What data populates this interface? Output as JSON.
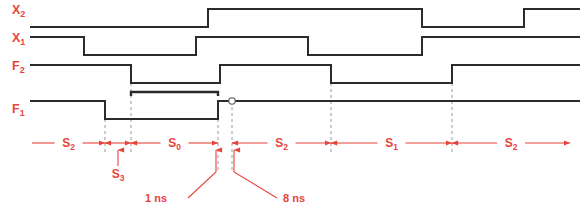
{
  "figure": {
    "type": "timing-diagram",
    "title": "",
    "background_color": "#ffffff",
    "waveform_color": "#2b2b2b",
    "annotation_color": "#e8443a",
    "gridline_color": "#9a9a9a",
    "width": 588,
    "height": 215
  },
  "signals": [
    {
      "id": "x2",
      "name": "X",
      "subscript": "2",
      "label_x": 12,
      "label_y": 14,
      "high_y": 9,
      "low_y": 27,
      "start_x": 30,
      "end_x": 580,
      "initial_level": "low",
      "transitions": [
        {
          "x": 208,
          "to": "high"
        },
        {
          "x": 422,
          "to": "low"
        },
        {
          "x": 524,
          "to": "high"
        }
      ]
    },
    {
      "id": "x1",
      "name": "X",
      "subscript": "1",
      "label_x": 12,
      "label_y": 42,
      "high_y": 37,
      "low_y": 55,
      "start_x": 30,
      "end_x": 580,
      "initial_level": "high",
      "transitions": [
        {
          "x": 84,
          "to": "low"
        },
        {
          "x": 196,
          "to": "high"
        },
        {
          "x": 308,
          "to": "low"
        },
        {
          "x": 422,
          "to": "high"
        }
      ]
    },
    {
      "id": "f2",
      "name": "F",
      "subscript": "2",
      "label_x": 12,
      "label_y": 70,
      "high_y": 65,
      "low_y": 83,
      "start_x": 30,
      "end_x": 580,
      "initial_level": "high",
      "transitions": [
        {
          "x": 131,
          "to": "low"
        },
        {
          "x": 220,
          "to": "high"
        },
        {
          "x": 331,
          "to": "low"
        },
        {
          "x": 452,
          "to": "high"
        }
      ]
    },
    {
      "id": "f1",
      "name": "F",
      "subscript": "1",
      "label_x": 12,
      "label_y": 113,
      "high_y": 101,
      "low_y": 119,
      "start_x": 30,
      "end_x": 580,
      "initial_level": "high",
      "transitions": [
        {
          "x": 105,
          "to": "low"
        },
        {
          "x": 218,
          "to": "high"
        }
      ]
    }
  ],
  "glitch_marker": {
    "x": 232,
    "y": 101,
    "shape": "small-circle",
    "radius": 3.2
  },
  "bracket": {
    "x1": 131,
    "x2": 218,
    "y": 92,
    "tick_height": 4
  },
  "gridlines": [
    {
      "x": 105,
      "y1": 101,
      "y2": 152
    },
    {
      "x": 131,
      "y1": 83,
      "y2": 152
    },
    {
      "x": 218,
      "y1": 101,
      "y2": 172
    },
    {
      "x": 232,
      "y1": 101,
      "y2": 172
    },
    {
      "x": 331,
      "y1": 83,
      "y2": 152
    },
    {
      "x": 452,
      "y1": 83,
      "y2": 152
    }
  ],
  "state_spans": [
    {
      "label": "S",
      "subscript": "2",
      "x1": 32,
      "x2": 105,
      "y": 143,
      "arrow_left": false,
      "arrow_right": true,
      "label_visible": true
    },
    {
      "label": "S",
      "subscript": "3",
      "x1": 105,
      "x2": 131,
      "y": 143,
      "arrow_left": true,
      "arrow_right": true,
      "label_visible": false
    },
    {
      "label": "S",
      "subscript": "0",
      "x1": 131,
      "x2": 218,
      "y": 143,
      "arrow_left": true,
      "arrow_right": true,
      "label_visible": true
    },
    {
      "label": "S",
      "subscript": "2",
      "x1": 232,
      "x2": 331,
      "y": 143,
      "arrow_left": true,
      "arrow_right": true,
      "label_visible": true
    },
    {
      "label": "S",
      "subscript": "1",
      "x1": 331,
      "x2": 452,
      "y": 143,
      "arrow_left": true,
      "arrow_right": true,
      "label_visible": true
    },
    {
      "label": "S",
      "subscript": "2",
      "x1": 452,
      "x2": 570,
      "y": 143,
      "arrow_left": true,
      "arrow_right": true,
      "label_visible": true
    }
  ],
  "callouts": [
    {
      "id": "s3",
      "label": "S",
      "subscript": "3",
      "text_x": 118,
      "text_y": 178,
      "arrow_from_x": 118,
      "arrow_from_y": 166,
      "arrow_to_x": 118,
      "arrow_to_y": 150
    },
    {
      "id": "one-ns",
      "text": "1 ns",
      "text_x": 167,
      "text_y": 202,
      "leader": [
        [
          188,
          198
        ],
        [
          216,
          172
        ],
        [
          216,
          150
        ]
      ]
    },
    {
      "id": "eight-ns",
      "text": "8 ns",
      "text_x": 283,
      "text_y": 202,
      "leader": [
        [
          277,
          198
        ],
        [
          234,
          172
        ],
        [
          234,
          150
        ]
      ]
    }
  ]
}
